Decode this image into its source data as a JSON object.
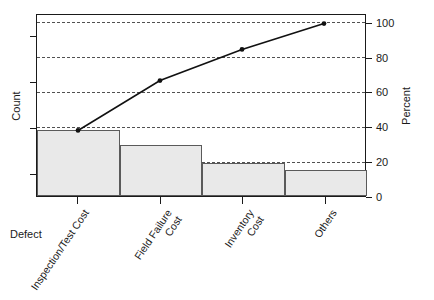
{
  "chart_data": {
    "type": "bar",
    "title": "",
    "subtitle": "",
    "categories": [
      "Inspection/Test Cost",
      "Field Failure Cost",
      "Inventory Cost",
      "Others"
    ],
    "category_lines": [
      [
        "Inspection/Test Cost"
      ],
      [
        "Field Failure",
        "Cost"
      ],
      [
        "Inventory",
        "Cost"
      ],
      [
        "Others"
      ]
    ],
    "series": [
      {
        "name": "Count",
        "type": "bar",
        "values": [
          38,
          29,
          19,
          15
        ]
      },
      {
        "name": "Cum Percent",
        "type": "line",
        "values": [
          38,
          67,
          85,
          100
        ]
      }
    ],
    "xlabel": "Defect",
    "ylabel": "Count",
    "y2label": "Percent",
    "y2ticks": [
      0,
      20,
      40,
      60,
      80,
      100
    ],
    "y2lim": [
      0,
      105
    ],
    "ylim": [
      0,
      105
    ],
    "y_ticks_labeled": false,
    "grid": true,
    "grid_axis": "y2",
    "legend": "none",
    "bar_color": "#e9e9e9",
    "bar_border_color": "#5a5a5a",
    "line_color": "#111111",
    "marker": "filled-circle",
    "axis_color": "#1a1a1a"
  },
  "axes": {
    "left": {
      "title": "Count",
      "tick_labels": []
    },
    "right": {
      "title": "Percent",
      "tick_labels": [
        "100",
        "80",
        "60",
        "40",
        "20",
        "0"
      ]
    },
    "bottom": {
      "title": "Defect",
      "tick_labels": [
        "Inspection/Test Cost",
        "Field Failure\nCost",
        "Inventory\nCost",
        "Others"
      ]
    }
  }
}
